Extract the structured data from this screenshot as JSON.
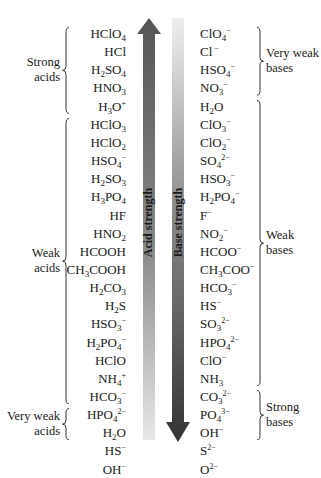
{
  "diagram": {
    "arrows": {
      "acid": {
        "label": "Acid strength",
        "direction": "up",
        "color_dark": "#555555",
        "color_light": "#e6e6e6"
      },
      "base": {
        "label": "Base strength",
        "direction": "down",
        "color_dark": "#333333",
        "color_light": "#e6e6e6"
      }
    },
    "acid_groups": [
      {
        "label_line1": "Strong",
        "label_line2": "acids",
        "start": 0,
        "end": 4
      },
      {
        "label_line1": "Weak",
        "label_line2": "acids",
        "start": 5,
        "end": 20
      },
      {
        "label_line1": "Very weak",
        "label_line2": "acids",
        "start": 21,
        "end": 22
      }
    ],
    "base_groups": [
      {
        "label_line1": "Very weak",
        "label_line2": "bases",
        "start": 0,
        "end": 3
      },
      {
        "label_line1": "Weak",
        "label_line2": "bases",
        "start": 4,
        "end": 19
      },
      {
        "label_line1": "Strong",
        "label_line2": "bases",
        "start": 20,
        "end": 22
      }
    ],
    "pairs": [
      {
        "acid": "HClO<sub>4</sub>",
        "base": "ClO<sub>4</sub><sup>&minus;</sup>"
      },
      {
        "acid": "HCl",
        "base": "Cl<sup>&nbsp;&minus;</sup>"
      },
      {
        "acid": "H<sub>2</sub>SO<sub>4</sub>",
        "base": "HSO<sub>4</sub><sup>&minus;</sup>"
      },
      {
        "acid": "HNO<sub>3</sub>",
        "base": "NO<sub>3</sub><sup>&minus;</sup>"
      },
      {
        "acid": "H<sub>3</sub>O<sup>+</sup>",
        "base": "H<sub>2</sub>O"
      },
      {
        "acid": "HClO<sub>3</sub>",
        "base": "ClO<sub>3</sub><sup>&minus;</sup>"
      },
      {
        "acid": "HClO<sub>2</sub>",
        "base": "ClO<sub>2</sub><sup>&minus;</sup>"
      },
      {
        "acid": "HSO<sub>4</sub><sup>&minus;</sup>",
        "base": "SO<sub>4</sub><sup>2&minus;</sup>"
      },
      {
        "acid": "H<sub>2</sub>SO<sub>3</sub>",
        "base": "HSO<sub>3</sub><sup>&minus;</sup>"
      },
      {
        "acid": "H<sub>3</sub>PO<sub>4</sub>",
        "base": "H<sub>2</sub>PO<sub>4</sub><sup>&minus;</sup>"
      },
      {
        "acid": "HF",
        "base": "F<sup>&minus;</sup>"
      },
      {
        "acid": "HNO<sub>2</sub>",
        "base": "NO<sub>2</sub><sup>&minus;</sup>"
      },
      {
        "acid": "HCOOH",
        "base": "HCOO<sup>&minus;</sup>"
      },
      {
        "acid": "CH<sub>3</sub>COOH",
        "base": "CH<sub>3</sub>COO<sup>&minus;</sup>"
      },
      {
        "acid": "H<sub>2</sub>CO<sub>3</sub>",
        "base": "HCO<sub>3</sub><sup>&minus;</sup>"
      },
      {
        "acid": "H<sub>2</sub>S",
        "base": "HS<sup>&minus;</sup>"
      },
      {
        "acid": "HSO<sub>3</sub><sup>&minus;</sup>",
        "base": "SO<sub>3</sub><sup>2&minus;</sup>"
      },
      {
        "acid": "H<sub>2</sub>PO<sub>4</sub><sup>&minus;</sup>",
        "base": "HPO<sub>4</sub><sup>2&minus;</sup>"
      },
      {
        "acid": "HClO",
        "base": "ClO<sup>&minus;</sup>"
      },
      {
        "acid": "NH<sub>4</sub><sup>+</sup>",
        "base": "NH<sub>3</sub>"
      },
      {
        "acid": "HCO<sub>3</sub><sup>&minus;</sup>",
        "base": "CO<sub>3</sub><sup>2&minus;</sup>"
      },
      {
        "acid": "HPO<sub>4</sub><sup>2&minus;</sup>",
        "base": "PO<sub>4</sub><sup>3&minus;</sup>"
      },
      {
        "acid": "H<sub>2</sub>O",
        "base": "OH<sup>&minus;</sup>"
      },
      {
        "acid": "HS<sup>&minus;</sup>",
        "base": "S<sup>2&minus;</sup>"
      },
      {
        "acid": "OH<sup>&minus;</sup>",
        "base": "O<sup>2&minus;</sup>"
      }
    ]
  }
}
